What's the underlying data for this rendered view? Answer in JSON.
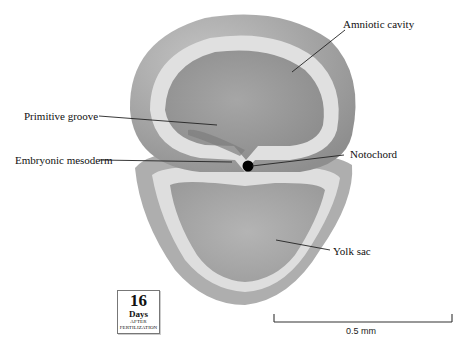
{
  "figure": {
    "labels": {
      "amniotic_cavity": "Amniotic cavity",
      "primitive_groove": "Primitive groove",
      "embryonic_mesoderm": "Embryonic mesoderm",
      "notochord": "Notochord",
      "yolk_sac": "Yolk sac"
    },
    "date_badge": {
      "number": "16",
      "unit": "Days",
      "line1": "AFTER",
      "line2": "FERTILIZATION"
    },
    "scale_bar": {
      "label": "0.5 mm"
    },
    "colors": {
      "outer_tissue": "#a9a9a9",
      "inner_cavity": "#9c9c9c",
      "cell_layer": "#dcdcdc",
      "notochord": "#000000"
    }
  }
}
